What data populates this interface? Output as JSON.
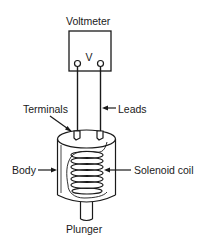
{
  "diagram": {
    "labels": {
      "voltmeter": "Voltmeter",
      "meter_symbol": "V",
      "terminals": "Terminals",
      "leads": "Leads",
      "body": "Body",
      "solenoid_coil": "Solenoid coil",
      "plunger": "Plunger"
    },
    "colors": {
      "line": "#1a1a1a",
      "background": "#ffffff"
    }
  }
}
